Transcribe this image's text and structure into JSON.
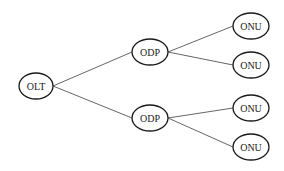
{
  "diagram": {
    "type": "tree",
    "colors": {
      "stroke": "#1a1a1a",
      "edge": "#555555",
      "background": "#ffffff"
    },
    "nodes": [
      {
        "id": "olt",
        "label": "OLT",
        "cx": 36,
        "cy": 86,
        "rx": 17,
        "ry": 13
      },
      {
        "id": "odp1",
        "label": "ODP",
        "cx": 150,
        "cy": 52,
        "rx": 18,
        "ry": 13
      },
      {
        "id": "odp2",
        "label": "ODP",
        "cx": 150,
        "cy": 118,
        "rx": 18,
        "ry": 13
      },
      {
        "id": "onu1",
        "label": "ONU",
        "cx": 251,
        "cy": 26,
        "rx": 18,
        "ry": 13
      },
      {
        "id": "onu2",
        "label": "ONU",
        "cx": 251,
        "cy": 65,
        "rx": 18,
        "ry": 13
      },
      {
        "id": "onu3",
        "label": "ONU",
        "cx": 251,
        "cy": 108,
        "rx": 18,
        "ry": 13
      },
      {
        "id": "onu4",
        "label": "ONU",
        "cx": 251,
        "cy": 147,
        "rx": 18,
        "ry": 13
      }
    ],
    "edges": [
      {
        "from": "olt",
        "to": "odp1"
      },
      {
        "from": "olt",
        "to": "odp2"
      },
      {
        "from": "odp1",
        "to": "onu1"
      },
      {
        "from": "odp1",
        "to": "onu2"
      },
      {
        "from": "odp2",
        "to": "onu3"
      },
      {
        "from": "odp2",
        "to": "onu4"
      }
    ]
  }
}
